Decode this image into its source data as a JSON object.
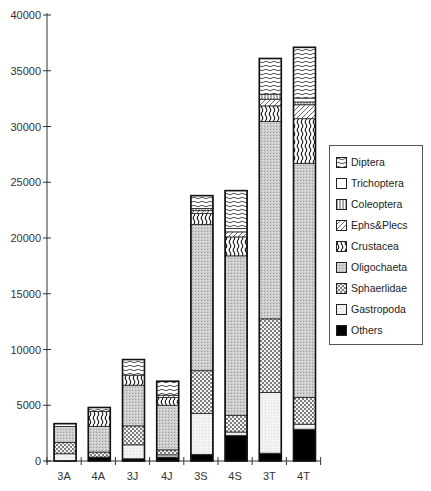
{
  "chart_data": {
    "type": "bar",
    "stacked": true,
    "title": "",
    "xlabel": "",
    "ylabel": "",
    "ylim": [
      0,
      40000
    ],
    "yticks": [
      0,
      5000,
      10000,
      15000,
      20000,
      25000,
      30000,
      35000,
      40000
    ],
    "grid": false,
    "legend_position": "right",
    "categories": [
      "3A",
      "4A",
      "3J",
      "4J",
      "3S",
      "4S",
      "3T",
      "4T"
    ],
    "series": [
      {
        "name": "Others",
        "pattern": "solid-black",
        "values": [
          0,
          350,
          200,
          350,
          600,
          2300,
          700,
          2850
        ]
      },
      {
        "name": "Gastropoda",
        "pattern": "light-stipple",
        "values": [
          650,
          0,
          1250,
          200,
          3650,
          300,
          5450,
          450
        ]
      },
      {
        "name": "Sphaeriidae",
        "pattern": "crosshatch",
        "values": [
          1000,
          450,
          1700,
          450,
          3850,
          1500,
          6600,
          2400
        ]
      },
      {
        "name": "Oligochaeta",
        "pattern": "grey-stipple",
        "values": [
          1450,
          2300,
          3650,
          4000,
          13100,
          14300,
          17700,
          21000
        ]
      },
      {
        "name": "Crustacea",
        "pattern": "wavy-vertical",
        "values": [
          0,
          1350,
          900,
          700,
          1000,
          1700,
          1400,
          4000
        ]
      },
      {
        "name": "Ephs&Plecs",
        "pattern": "diagonal",
        "values": [
          0,
          0,
          0,
          200,
          250,
          450,
          600,
          1250
        ]
      },
      {
        "name": "Coleoptera",
        "pattern": "vertical-lines",
        "values": [
          0,
          0,
          0,
          0,
          200,
          0,
          450,
          250
        ]
      },
      {
        "name": "Trichoptera",
        "pattern": "white",
        "values": [
          250,
          0,
          0,
          0,
          0,
          300,
          0,
          350
        ]
      },
      {
        "name": "Diptera",
        "pattern": "wavy-horizontal",
        "values": [
          0,
          350,
          1400,
          1250,
          1150,
          3400,
          3200,
          4550
        ]
      }
    ]
  },
  "legend": {
    "items": [
      {
        "label": "Diptera",
        "pattern": "wavy-horizontal"
      },
      {
        "label": "Trichoptera",
        "pattern": "white"
      },
      {
        "label": "Coleoptera",
        "pattern": "vertical-lines"
      },
      {
        "label": "Ephs&Plecs",
        "pattern": "diagonal"
      },
      {
        "label": "Crustacea",
        "pattern": "wavy-vertical"
      },
      {
        "label": "Oligochaeta",
        "pattern": "grey-stipple"
      },
      {
        "label": "Sphaerlidae",
        "pattern": "crosshatch"
      },
      {
        "label": "Gastropoda",
        "pattern": "light-stipple"
      },
      {
        "label": "Others",
        "pattern": "solid-black"
      }
    ]
  },
  "axes": {
    "y_tick_labels": [
      "0",
      "5000",
      "10000",
      "15000",
      "20000",
      "25000",
      "30000",
      "35000",
      "40000"
    ],
    "x_tick_labels": [
      "3A",
      "4A",
      "3J",
      "4J",
      "3S",
      "4S",
      "3T",
      "4T"
    ]
  },
  "colors": {
    "axis": "#333333",
    "bar_outline": "#222222",
    "oligochaeta_fill": "#c8c8c8",
    "gastropoda_fill": "#f2f2f2",
    "others_fill": "#000000"
  }
}
